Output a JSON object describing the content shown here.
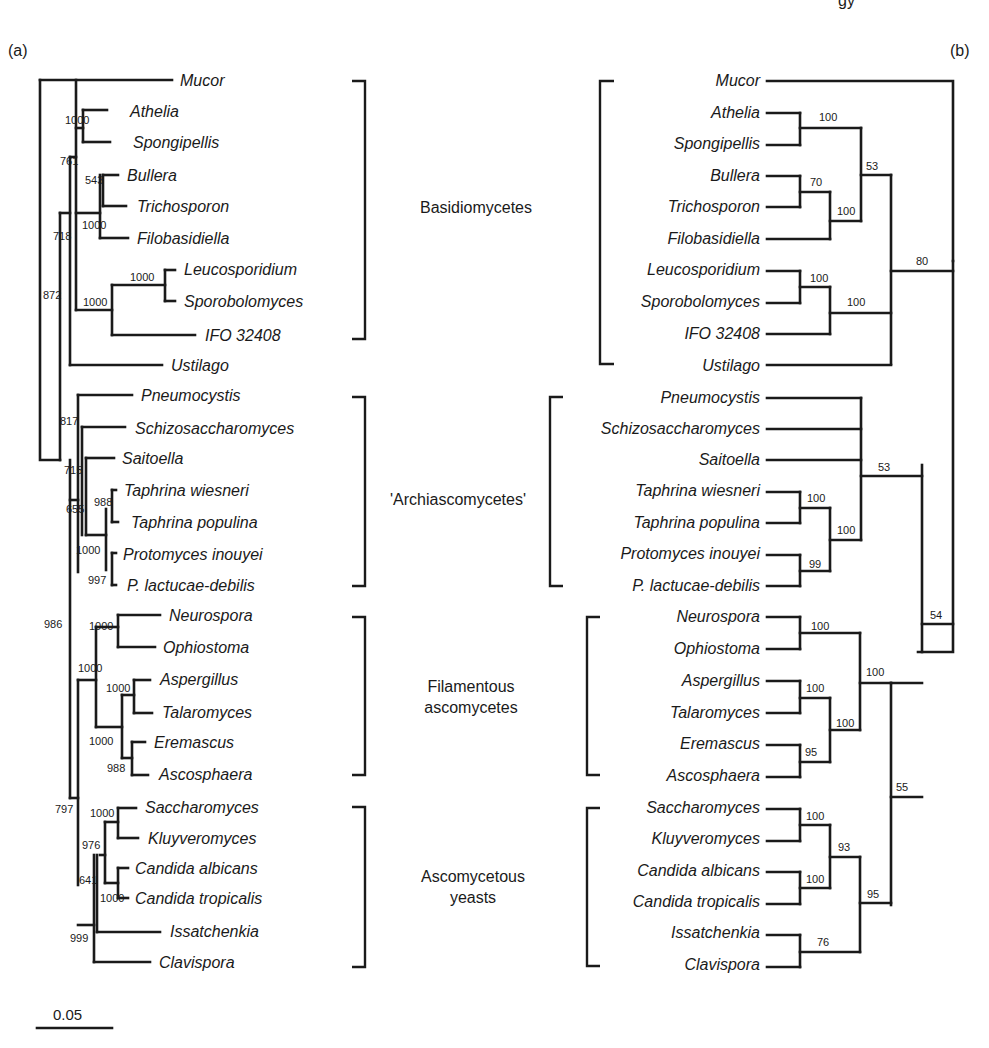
{
  "page_header_fragment": "gy",
  "panel_a": {
    "label": "(a)",
    "method": "distance / neighbor-joining with bootstrap (of 1000)",
    "scale_bar": {
      "label": "0.05"
    },
    "taxa": [
      "Mucor",
      "Athelia",
      "Spongipellis",
      "Bullera",
      "Trichosporon",
      "Filobasidiella",
      "Leucosporidium",
      "Sporobolomyces",
      "IFO 32408",
      "Ustilago",
      "Pneumocystis",
      "Schizosaccharomyces",
      "Saitoella",
      "Taphrina wiesneri",
      "Taphrina populina",
      "Protomyces inouyei",
      "P. lactucae-debilis",
      "Neurospora",
      "Ophiostoma",
      "Aspergillus",
      "Talaromyces",
      "Eremascus",
      "Ascosphaera",
      "Saccharomyces",
      "Kluyveromyces",
      "Candida albicans",
      "Candida tropicalis",
      "Issatchenkia",
      "Clavispora"
    ],
    "bootstrap_values": [
      "1000",
      "761",
      "543",
      "1000",
      "718",
      "1000",
      "1000",
      "872",
      "817",
      "715",
      "988",
      "655",
      "1000",
      "997",
      "986",
      "1000",
      "1000",
      "1000",
      "1000",
      "988",
      "797",
      "1000",
      "976",
      "641",
      "1000",
      "999"
    ]
  },
  "panel_b": {
    "label": "(b)",
    "method": "parsimony / consensus with bootstrap (%)",
    "taxa": [
      "Mucor",
      "Athelia",
      "Spongipellis",
      "Bullera",
      "Trichosporon",
      "Filobasidiella",
      "Leucosporidium",
      "Sporobolomyces",
      "IFO 32408",
      "Ustilago",
      "Pneumocystis",
      "Schizosaccharomyces",
      "Saitoella",
      "Taphrina wiesneri",
      "Taphrina populina",
      "Protomyces inouyei",
      "P. lactucae-debilis",
      "Neurospora",
      "Ophiostoma",
      "Aspergillus",
      "Talaromyces",
      "Eremascus",
      "Ascosphaera",
      "Saccharomyces",
      "Kluyveromyces",
      "Candida albicans",
      "Candida tropicalis",
      "Issatchenkia",
      "Clavispora"
    ],
    "bootstrap_values": [
      "100",
      "53",
      "70",
      "100",
      "100",
      "100",
      "80",
      "53",
      "100",
      "100",
      "99",
      "100",
      "100",
      "100",
      "100",
      "95",
      "55",
      "54",
      "100",
      "93",
      "100",
      "95",
      "76"
    ]
  },
  "groups": [
    {
      "name": "Basidiomycetes",
      "lines": [
        "Basidiomycetes"
      ],
      "members": [
        "Athelia",
        "Spongipellis",
        "Bullera",
        "Trichosporon",
        "Filobasidiella",
        "Leucosporidium",
        "Sporobolomyces",
        "IFO 32408",
        "Ustilago"
      ]
    },
    {
      "name": "'Archiascomycetes'",
      "lines": [
        "'Archiascomycetes'"
      ],
      "members": [
        "Pneumocystis",
        "Schizosaccharomyces",
        "Saitoella",
        "Taphrina wiesneri",
        "Taphrina populina",
        "Protomyces inouyei",
        "P. lactucae-debilis"
      ]
    },
    {
      "name": "Filamentous ascomycetes",
      "lines": [
        "Filamentous",
        "ascomycetes"
      ],
      "members": [
        "Neurospora",
        "Ophiostoma",
        "Aspergillus",
        "Talaromyces",
        "Eremascus",
        "Ascosphaera"
      ]
    },
    {
      "name": "Ascomycetous yeasts",
      "lines": [
        "Ascomycetous",
        "yeasts"
      ],
      "members": [
        "Saccharomyces",
        "Kluyveromyces",
        "Candida albicans",
        "Candida tropicalis",
        "Issatchenkia",
        "Clavispora"
      ]
    }
  ]
}
